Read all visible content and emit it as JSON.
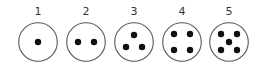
{
  "diagram": {
    "items": [
      {
        "label": "1",
        "cx": 38,
        "dots": [
          [
            0,
            0
          ]
        ]
      },
      {
        "label": "2",
        "cx": 86,
        "dots": [
          [
            -8,
            0
          ],
          [
            8,
            0
          ]
        ]
      },
      {
        "label": "3",
        "cx": 134,
        "dots": [
          [
            0,
            -7
          ],
          [
            -8,
            5
          ],
          [
            8,
            5
          ]
        ]
      },
      {
        "label": "4",
        "cx": 182,
        "dots": [
          [
            -8,
            -8
          ],
          [
            8,
            -8
          ],
          [
            -8,
            8
          ],
          [
            8,
            8
          ]
        ]
      },
      {
        "label": "5",
        "cx": 229,
        "dots": [
          [
            -8,
            -8
          ],
          [
            8,
            -8
          ],
          [
            0,
            0
          ],
          [
            -8,
            8
          ],
          [
            8,
            8
          ]
        ]
      }
    ],
    "colors": {
      "stroke": "#555555",
      "dot": "#111111"
    }
  }
}
